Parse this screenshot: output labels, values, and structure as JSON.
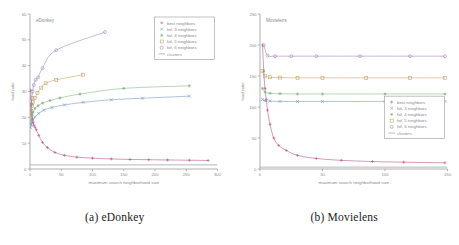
{
  "figure": {
    "captions": [
      {
        "label": "(a) eDonkey"
      },
      {
        "label": "(b) Movielens"
      }
    ]
  },
  "chart_data": [
    {
      "type": "scatter",
      "title": "eDonkey",
      "panel_caption": "(a) eDonkey",
      "xlabel": "maximum search neighborhood size",
      "ylabel": "load ratio",
      "xlim": [
        0,
        300
      ],
      "ylim": [
        0,
        60
      ],
      "xticks": [
        0,
        50,
        100,
        150,
        200,
        250,
        300
      ],
      "yticks": [
        0,
        10,
        20,
        30,
        40,
        50,
        60
      ],
      "grid": false,
      "legend_position": "top-right",
      "series": [
        {
          "name": "best neighbors",
          "marker": "plus",
          "color": "#b0487a",
          "x": [
            1,
            2,
            3,
            4,
            5,
            6,
            8,
            10,
            14,
            20,
            28,
            40,
            55,
            75,
            100,
            130,
            160,
            190,
            220,
            255,
            285
          ],
          "y": [
            30.5,
            25.0,
            21.0,
            19.5,
            18.0,
            17.0,
            16.2,
            15.2,
            13.0,
            10.3,
            8.3,
            6.4,
            5.3,
            4.6,
            4.2,
            3.9,
            3.7,
            3.6,
            3.5,
            3.4,
            3.3
          ]
        },
        {
          "name": "fof, 3 neighbors",
          "marker": "cross",
          "color": "#6f8fc0",
          "x": [
            1,
            2,
            3,
            5,
            8,
            14,
            22,
            35,
            55,
            85,
            130,
            180,
            255
          ],
          "y": [
            16.0,
            17.0,
            18.0,
            19.0,
            20.2,
            21.5,
            22.8,
            23.8,
            24.8,
            25.8,
            26.8,
            27.4,
            28.2
          ]
        },
        {
          "name": "fof, 4 neighbors",
          "marker": "star",
          "color": "#7fb07f",
          "x": [
            1,
            2,
            3,
            5,
            8,
            13,
            20,
            32,
            48,
            80,
            150,
            255
          ],
          "y": [
            17.5,
            19.0,
            20.5,
            22.0,
            23.5,
            24.5,
            25.5,
            26.5,
            27.5,
            29.0,
            31.2,
            32.2
          ]
        },
        {
          "name": "fof, 5 neighbors",
          "marker": "box",
          "color": "#c0a060",
          "x": [
            1,
            2,
            3,
            5,
            8,
            12,
            18,
            25,
            42,
            85
          ],
          "y": [
            20.0,
            22.5,
            24.5,
            26.0,
            27.5,
            29.5,
            31.5,
            33.2,
            34.5,
            36.5
          ]
        },
        {
          "name": "fof, 6 neighbors",
          "marker": "circle",
          "color": "#9f7fb8",
          "x": [
            1,
            2,
            3,
            4,
            6,
            9,
            13,
            20,
            42,
            120
          ],
          "y": [
            22.0,
            25.0,
            27.5,
            30.0,
            32.5,
            34.5,
            35.5,
            39.0,
            46.0,
            53.0
          ]
        },
        {
          "name": "clusters",
          "marker": "line",
          "color": "#8a8a8a",
          "x": [
            0,
            300
          ],
          "y": [
            1.6,
            1.6
          ]
        }
      ]
    },
    {
      "type": "scatter",
      "title": "Movielens",
      "panel_caption": "(b) Movielens",
      "xlabel": "maximum search neighborhood size",
      "ylabel": "load ratio",
      "xlim": [
        0,
        150
      ],
      "ylim": [
        0,
        250
      ],
      "xticks": [
        0,
        50,
        100,
        150
      ],
      "yticks": [
        0,
        50,
        100,
        150,
        200,
        250
      ],
      "grid": false,
      "legend_position": "middle-right",
      "series": [
        {
          "name": "best neighbors",
          "marker": "plus",
          "color": "#b0487a",
          "x": [
            2,
            3,
            4,
            5,
            6,
            8,
            11,
            15,
            21,
            30,
            45,
            65,
            90,
            115,
            148
          ],
          "y": [
            200.0,
            158.0,
            130.0,
            112.0,
            95.0,
            72.0,
            50.0,
            38.0,
            30.0,
            22.0,
            17.0,
            14.0,
            12.0,
            11.0,
            10.0
          ]
        },
        {
          "name": "fof, 3 neighbors",
          "marker": "cross",
          "color": "#6f8fc0",
          "x": [
            2,
            4,
            8,
            16,
            30,
            50,
            100,
            148
          ],
          "y": [
            112.0,
            110.0,
            109.5,
            109.0,
            109.0,
            109.0,
            109.0,
            109.0
          ]
        },
        {
          "name": "fof, 4 neighbors",
          "marker": "star",
          "color": "#7fb07f",
          "x": [
            2,
            4,
            8,
            16,
            30,
            50,
            100,
            148
          ],
          "y": [
            130.0,
            124.0,
            122.0,
            121.5,
            121.0,
            121.0,
            121.0,
            121.0
          ]
        },
        {
          "name": "fof, 5 neighbors",
          "marker": "box",
          "color": "#c0a060",
          "x": [
            2,
            4,
            8,
            16,
            30,
            50,
            85,
            120,
            148
          ],
          "y": [
            158.0,
            150.0,
            148.0,
            147.5,
            147.0,
            147.0,
            147.0,
            147.0,
            147.0
          ]
        },
        {
          "name": "fof, 6 neighbors",
          "marker": "circle",
          "color": "#9f7fb8",
          "x": [
            3,
            6,
            12,
            25,
            45,
            80,
            120,
            148
          ],
          "y": [
            200.0,
            183.0,
            182.0,
            182.0,
            182.0,
            182.0,
            182.0,
            182.0
          ]
        },
        {
          "name": "clusters",
          "marker": "line",
          "color": "#8a8a8a",
          "x": [
            0,
            150
          ],
          "y": [
            3.0,
            3.0
          ]
        }
      ]
    }
  ]
}
